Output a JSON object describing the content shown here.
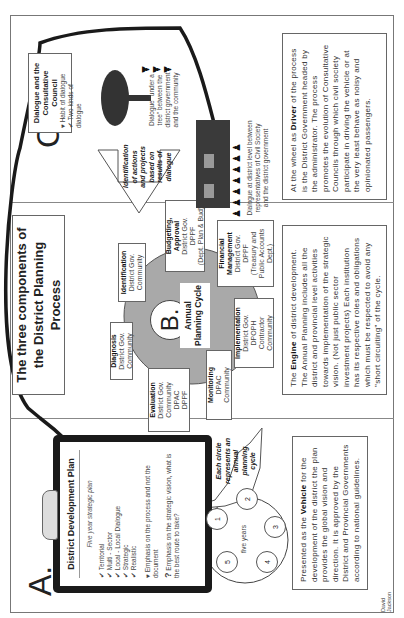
{
  "diagram": {
    "title": "The three components of the District Planning Process",
    "author": "David Jackson",
    "panel_a": {
      "letter": "A.",
      "clipboard_title": "District Development Plan",
      "subtitle": "Five year strategic plan",
      "checklist": [
        "Territorial",
        "Multi - Sector",
        "Local - Local Dialogue",
        "Strategic",
        "Realistic"
      ],
      "heart_note": "Emphasis on the process and not the document",
      "question_note": "Emphasis on the strategic vision, what is the best route to take?",
      "five_year_label": "five years",
      "circle_numbers": [
        "1",
        "2",
        "3",
        "4",
        "5"
      ],
      "callout": "Each circle represents an annual planning cycle",
      "vehicle_pre": "Presented as the ",
      "vehicle_bold": "Vehicle",
      "vehicle_post": " for the development of the district the plan provides the global vision and direction. It is approved by the District and Provincial Governments according to national guidelines."
    },
    "panel_b": {
      "letter": "B.",
      "center_label": "Annual Planning Cycle",
      "stages": [
        {
          "name": "Identification",
          "actors": [
            "District Gov.",
            "Community"
          ]
        },
        {
          "name": "Budgeting, Approval",
          "actors": [
            "District Gov.",
            "DPPF",
            "(Dept. Plan & Bud)"
          ]
        },
        {
          "name": "Financial Management",
          "actors": [
            "District Gov.",
            "DPPF",
            "(Treasury and Public Accounts Dept.)"
          ]
        },
        {
          "name": "Implementation",
          "actors": [
            "District Gov.",
            "DPOPH",
            "Contractor",
            "Community"
          ]
        },
        {
          "name": "Monitoring",
          "actors": [
            "DPAC",
            "Community"
          ]
        },
        {
          "name": "Evaluation",
          "actors": [
            "District Gov.",
            "Community",
            "DPAC",
            "DPPF"
          ]
        },
        {
          "name": "Diagnosis",
          "actors": [
            "District Gov.",
            "Community"
          ]
        }
      ],
      "engine_pre": "The ",
      "engine_bold": "Engine",
      "engine_post": " of district development. The Annual Planning includes all the district and provincial level activities towards implementation of the strategic vision. (Not just public sector investment projects) Each institution has its respective roles and obligations which must be respected to avoid any \"short circuiting\" of the cycle."
    },
    "panel_c": {
      "letter": "C.",
      "box_title": "Dialogue and the Consultative Council",
      "box_items": [
        "Habit of dialogue",
        "Two kinds of dialogue"
      ],
      "arrow_note": "Identification of actions and projects based on results of dialogue",
      "tree_caption": "Dialogue \"under a tree\" between the district government and the community",
      "building_caption": "Dialogue at district level between representatives of Civil Society and the district government",
      "driver_pre": "At the wheel as ",
      "driver_bold": "Driver",
      "driver_post": " of the process is the District Government headed by the administrator. The process promotes the evolution of Consultative Councils through which civil society participate in driving the vehicle or at the very least behave as noisy and opinionated passengers."
    },
    "colors": {
      "cycle_fill": "#a9a9a9",
      "clipboard": "#1a1a1a",
      "border": "#777777",
      "arrow": "#1a1a1a"
    }
  }
}
